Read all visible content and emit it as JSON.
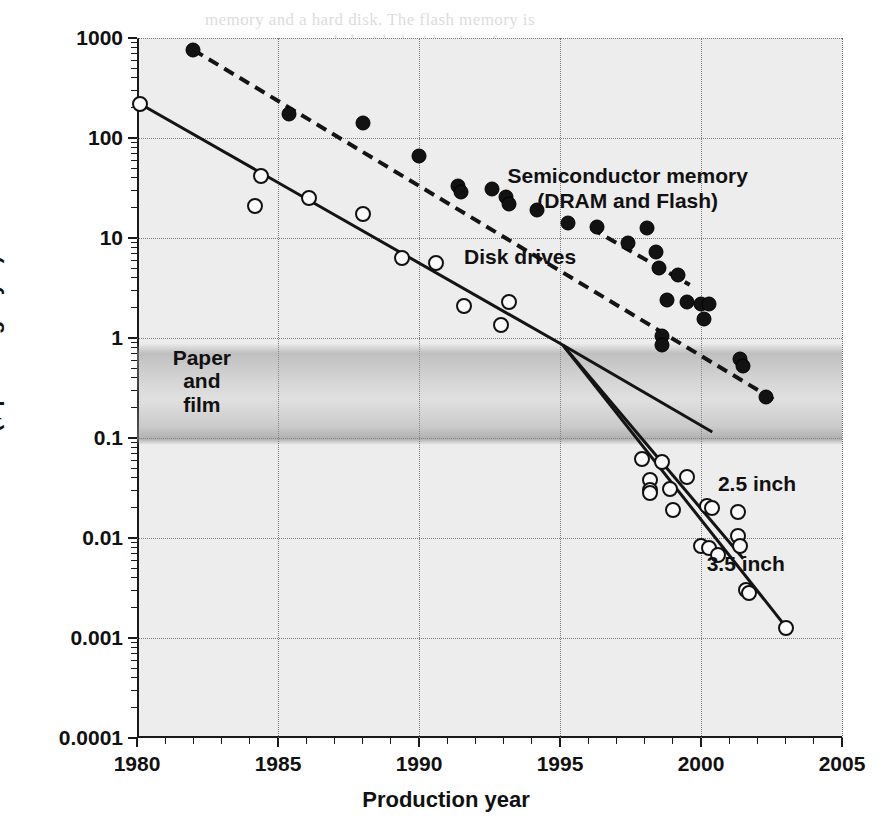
{
  "chart_data": {
    "type": "scatter",
    "title": "",
    "xlabel": "Production year",
    "ylabel": "Price ($ per megabyte)",
    "xlim": [
      1980,
      2005
    ],
    "ylim": [
      0.0001,
      1000
    ],
    "yscale": "log",
    "xscale": "linear",
    "grid": true,
    "legend_position": "inline-annotations",
    "xticks": [
      1980,
      1985,
      1990,
      1995,
      2000,
      2005
    ],
    "xtick_labels": [
      "1980",
      "1985",
      "1990",
      "1995",
      "2000",
      "2005"
    ],
    "xtick_minor_step": 1,
    "yticks": [
      1000,
      100,
      10,
      1,
      0.1,
      0.01,
      0.001,
      0.0001
    ],
    "ytick_labels": [
      "1000",
      "100",
      "10",
      "1",
      "0.1",
      "0.01",
      "0.001",
      "0.0001"
    ],
    "gridlines_x": [
      1985,
      1990,
      1995,
      2000,
      2005
    ],
    "gridlines_y": [
      1000,
      100,
      10,
      1,
      0.1,
      0.01,
      0.001
    ],
    "annotations": [
      {
        "id": "semiconductor",
        "text_line1": "Semiconductor memory",
        "text_line2": "(DRAM and Flash)",
        "x": 1997.4,
        "y": 33
      },
      {
        "id": "disk-drives",
        "text": "Disk drives",
        "x": 1991.6,
        "y": 6.2
      },
      {
        "id": "paper-and-film",
        "text_line1": "Paper",
        "text_line2": "and",
        "text_line3": "film",
        "x": 1982.3,
        "y": 0.42
      },
      {
        "id": "two-five-inch",
        "text": "2.5 inch",
        "x": 2000.6,
        "y": 0.033
      },
      {
        "id": "three-five-inch",
        "text": "3.5 inch",
        "x": 2000.2,
        "y": 0.0053
      }
    ],
    "bands": [
      {
        "id": "paper-and-film-band",
        "label": "Paper and film",
        "y_top": 0.9,
        "y_bottom": 0.085,
        "color": "#9a9a9a"
      }
    ],
    "series": [
      {
        "name": "Semiconductor memory (DRAM and Flash)",
        "marker": "filled-circle",
        "color": "#121212",
        "trendline": "dashed",
        "points": [
          {
            "x": 1982.0,
            "y": 760
          },
          {
            "x": 1985.4,
            "y": 175
          },
          {
            "x": 1988.0,
            "y": 140
          },
          {
            "x": 1990.0,
            "y": 66
          },
          {
            "x": 1991.4,
            "y": 33
          },
          {
            "x": 1991.5,
            "y": 29
          },
          {
            "x": 1992.6,
            "y": 31
          },
          {
            "x": 1993.1,
            "y": 26
          },
          {
            "x": 1993.2,
            "y": 22
          },
          {
            "x": 1994.2,
            "y": 19
          },
          {
            "x": 1995.3,
            "y": 14
          },
          {
            "x": 1996.3,
            "y": 13
          },
          {
            "x": 1997.4,
            "y": 9.0
          },
          {
            "x": 1998.1,
            "y": 12.5
          },
          {
            "x": 1998.4,
            "y": 7.2
          },
          {
            "x": 1998.5,
            "y": 5.0
          },
          {
            "x": 1999.2,
            "y": 4.3
          },
          {
            "x": 1998.8,
            "y": 2.4
          },
          {
            "x": 1999.5,
            "y": 2.3
          },
          {
            "x": 2000.0,
            "y": 2.2
          },
          {
            "x": 2000.3,
            "y": 2.2
          },
          {
            "x": 1998.6,
            "y": 1.05
          },
          {
            "x": 1998.6,
            "y": 0.85
          },
          {
            "x": 2000.1,
            "y": 1.55
          },
          {
            "x": 2001.4,
            "y": 0.62
          },
          {
            "x": 2001.5,
            "y": 0.52
          },
          {
            "x": 2002.3,
            "y": 0.26
          }
        ],
        "trendline_points": [
          {
            "x": 1982.0,
            "y": 760
          },
          {
            "x": 2002.6,
            "y": 0.24
          }
        ],
        "trendline_branch": [
          {
            "x": 1996.1,
            "y": 12.5
          },
          {
            "x": 1999.6,
            "y": 3.4
          }
        ]
      },
      {
        "name": "Disk drives",
        "marker": "open-circle",
        "color": "#111111",
        "trendline": "solid",
        "points": [
          {
            "x": 1980.1,
            "y": 220
          },
          {
            "x": 1984.4,
            "y": 42
          },
          {
            "x": 1984.2,
            "y": 21
          },
          {
            "x": 1986.1,
            "y": 25
          },
          {
            "x": 1988.0,
            "y": 17.5
          },
          {
            "x": 1989.4,
            "y": 6.3
          },
          {
            "x": 1990.6,
            "y": 5.6
          },
          {
            "x": 1991.6,
            "y": 2.1
          },
          {
            "x": 1992.9,
            "y": 1.35
          },
          {
            "x": 1993.2,
            "y": 2.3
          },
          {
            "x": 1997.9,
            "y": 0.062
          },
          {
            "x": 1998.6,
            "y": 0.058
          },
          {
            "x": 1998.2,
            "y": 0.038
          },
          {
            "x": 1998.2,
            "y": 0.03
          },
          {
            "x": 1998.2,
            "y": 0.028
          },
          {
            "x": 1998.9,
            "y": 0.031
          },
          {
            "x": 1999.5,
            "y": 0.041
          },
          {
            "x": 1999.0,
            "y": 0.019
          },
          {
            "x": 2000.2,
            "y": 0.021
          },
          {
            "x": 2000.4,
            "y": 0.02
          },
          {
            "x": 2001.3,
            "y": 0.018
          },
          {
            "x": 2000.0,
            "y": 0.0083
          },
          {
            "x": 2000.3,
            "y": 0.008
          },
          {
            "x": 2000.6,
            "y": 0.0068
          },
          {
            "x": 2001.3,
            "y": 0.0105
          },
          {
            "x": 2001.4,
            "y": 0.0083
          },
          {
            "x": 2001.6,
            "y": 0.003
          },
          {
            "x": 2001.7,
            "y": 0.0028
          },
          {
            "x": 2003.0,
            "y": 0.00125
          }
        ],
        "trendline_points": [
          {
            "x": 1980.1,
            "y": 220
          },
          {
            "x": 1995.1,
            "y": 0.85
          }
        ]
      },
      {
        "name": "2.5 inch",
        "marker": "open-circle",
        "trendline": "solid",
        "trendline_points": [
          {
            "x": 1995.1,
            "y": 0.85
          },
          {
            "x": 2001.5,
            "y": 0.0062
          }
        ]
      },
      {
        "name": "3.5 inch",
        "marker": "open-circle",
        "trendline": "solid",
        "trendline_points": [
          {
            "x": 1995.1,
            "y": 0.85
          },
          {
            "x": 2003.1,
            "y": 0.0012
          }
        ]
      },
      {
        "name": "combined-disk-projection",
        "marker": "none",
        "trendline": "solid",
        "trendline_points": [
          {
            "x": 1995.1,
            "y": 0.85
          },
          {
            "x": 2000.4,
            "y": 0.115
          }
        ]
      }
    ]
  },
  "bleed_text": [
    {
      "text": "memory and a hard disk. The flash memory is",
      "x": 205,
      "y": 10
    },
    {
      "text": "components are encoded with the identity of",
      "x": 178,
      "y": 32
    },
    {
      "text": "a specific device that can, in principle, control",
      "x": 170,
      "y": 54
    },
    {
      "text": "the accessible content.",
      "x": 178,
      "y": 76
    },
    {
      "text": "Memory",
      "x": 430,
      "y": 112
    },
    {
      "text": "the storage medium. A rewritable, erasable",
      "x": 206,
      "y": 232
    },
    {
      "text": "device. Storage accumulates on the disk",
      "x": 206,
      "y": 254
    },
    {
      "text": "drive and the disk is never full.",
      "x": 206,
      "y": 276
    },
    {
      "text": "Memory devices that use a reversible effect",
      "x": 196,
      "y": 452
    },
    {
      "text": "to store information fall into a class of",
      "x": 196,
      "y": 474
    },
    {
      "text": "devices whose performance and cost depend",
      "x": 186,
      "y": 560
    },
    {
      "text": "on the areal density and speed. These are",
      "x": 186,
      "y": 582
    },
    {
      "text": "the elements that allow for reading back a",
      "x": 186,
      "y": 604
    },
    {
      "text": "stored bit and for writing a new one.",
      "x": 186,
      "y": 626
    },
    {
      "text": "The rate of increase for flash memory",
      "x": 186,
      "y": 648
    },
    {
      "text": "and the storage density of disks",
      "x": 186,
      "y": 690
    },
    {
      "text": "continues to rise steadily each year",
      "x": 186,
      "y": 712
    }
  ]
}
